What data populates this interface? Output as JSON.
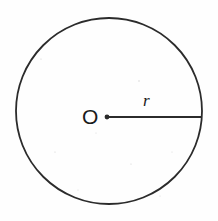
{
  "figure": {
    "kind": "geometry-diagram",
    "background_color": "#fefefe",
    "stroke_color": "#2b2b2b",
    "label_color": "#1a1a1a",
    "circle": {
      "center_x": 109,
      "center_y": 111,
      "radius": 93,
      "stroke_width": 1.8,
      "fill": "none"
    },
    "center_point": {
      "x": 107,
      "y": 117,
      "dot_radius": 2.4
    },
    "radius_segment": {
      "x1": 107,
      "y1": 117,
      "x2": 202,
      "y2": 117,
      "stroke_width": 1.8
    },
    "labels": {
      "center": "O",
      "radius": "r"
    },
    "speckles": [
      {
        "x": 41,
        "y": 59,
        "r": 0.6
      },
      {
        "x": 139,
        "y": 81,
        "r": 0.7
      },
      {
        "x": 55,
        "y": 152,
        "r": 0.6
      },
      {
        "x": 131,
        "y": 164,
        "r": 0.6
      },
      {
        "x": 172,
        "y": 152,
        "r": 0.5
      },
      {
        "x": 96,
        "y": 133,
        "r": 0.5
      },
      {
        "x": 78,
        "y": 190,
        "r": 0.5
      },
      {
        "x": 160,
        "y": 196,
        "r": 0.5
      }
    ]
  }
}
